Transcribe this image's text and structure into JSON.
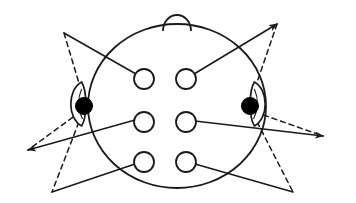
{
  "figure": {
    "width": 356,
    "height": 203,
    "background_color": "#FFFFFF",
    "stroke_color": "#1A1A1A",
    "electrode_fill": "#FFFFFF",
    "reference_fill": "#000000",
    "stroke_width": 1.6,
    "dash_pattern": "5,4"
  },
  "head": {
    "label": "head-outline",
    "center_x": 177,
    "center_y": 106,
    "radius_x": 89,
    "radius_y": 82
  },
  "nose": {
    "label": "nose",
    "center_x": 177,
    "center_y": 25,
    "radius": 14
  },
  "ears": [
    {
      "label": "left-ear",
      "side": "left",
      "x": 84,
      "y": 104,
      "width": 16,
      "height": 44
    },
    {
      "label": "right-ear",
      "side": "right",
      "x": 252,
      "y": 104,
      "width": 16,
      "height": 44
    }
  ],
  "reference_electrodes": [
    {
      "label": "A1",
      "side": "left",
      "cx": 84,
      "cy": 106,
      "r": 8.5,
      "fill": "#000000"
    },
    {
      "label": "A2",
      "side": "right",
      "cx": 250,
      "cy": 106,
      "r": 8.5,
      "fill": "#000000"
    }
  ],
  "scalp_electrodes": [
    {
      "label": "F3",
      "row": "frontal",
      "column": "left",
      "cx": 144,
      "cy": 79,
      "r": 10
    },
    {
      "label": "F4",
      "row": "frontal",
      "column": "right",
      "cx": 186,
      "cy": 79,
      "r": 10
    },
    {
      "label": "C3",
      "row": "central",
      "column": "left",
      "cx": 144,
      "cy": 122,
      "r": 10
    },
    {
      "label": "C4",
      "row": "central",
      "column": "right",
      "cx": 186,
      "cy": 122,
      "r": 10
    },
    {
      "label": "P3",
      "row": "parietal",
      "column": "left",
      "cx": 144,
      "cy": 162,
      "r": 10
    },
    {
      "label": "P4",
      "row": "parietal",
      "column": "right",
      "cx": 186,
      "cy": 162,
      "r": 10
    }
  ],
  "apex_points": [
    {
      "label": "apex-top-left",
      "x": 64,
      "y": 33,
      "arrow": false
    },
    {
      "label": "apex-top-right",
      "x": 277,
      "y": 24,
      "arrow": true
    },
    {
      "label": "apex-bottom-left",
      "x": 28,
      "y": 150,
      "arrow": true
    },
    {
      "label": "apex-bottom-right",
      "x": 323,
      "y": 136,
      "arrow": true
    },
    {
      "label": "apex-lower-left",
      "x": 52,
      "y": 192,
      "arrow": false
    },
    {
      "label": "apex-lower-right",
      "x": 293,
      "y": 192,
      "arrow": false
    }
  ],
  "solid_lines": [
    {
      "label": "line-apex-topleft-to-F3",
      "x1": 64,
      "y1": 33,
      "x2": 136,
      "y2": 74
    },
    {
      "label": "line-apex-topright-to-F4",
      "x1": 277,
      "y1": 24,
      "x2": 194,
      "y2": 74
    },
    {
      "label": "line-apex-bottomleft-to-C3",
      "x1": 28,
      "y1": 150,
      "x2": 135,
      "y2": 120
    },
    {
      "label": "line-apex-bottomright-to-C4",
      "x1": 323,
      "y1": 136,
      "x2": 195,
      "y2": 121
    },
    {
      "label": "line-apex-lowerleft-to-P3",
      "x1": 52,
      "y1": 192,
      "x2": 135,
      "y2": 164
    },
    {
      "label": "line-apex-lowerright-to-P4",
      "x1": 293,
      "y1": 192,
      "x2": 195,
      "y2": 164
    }
  ],
  "dashed_lines": [
    {
      "label": "dash-apex-topleft-to-leftear",
      "x1": 64,
      "y1": 33,
      "x2": 84,
      "y2": 100
    },
    {
      "label": "dash-apex-topright-to-rightear",
      "x1": 277,
      "y1": 24,
      "x2": 251,
      "y2": 100
    },
    {
      "label": "dash-leftear-to-apex-bottomleft",
      "x1": 80,
      "y1": 112,
      "x2": 28,
      "y2": 150
    },
    {
      "label": "dash-rightear-to-apex-bottomright",
      "x1": 255,
      "y1": 112,
      "x2": 323,
      "y2": 136
    },
    {
      "label": "dash-leftear-to-apex-lowerleft",
      "x1": 82,
      "y1": 114,
      "x2": 52,
      "y2": 192
    },
    {
      "label": "dash-rightear-to-apex-lowerright",
      "x1": 253,
      "y1": 114,
      "x2": 293,
      "y2": 192
    }
  ]
}
